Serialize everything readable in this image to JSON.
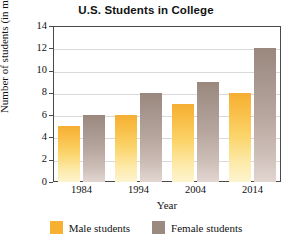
{
  "chart_data": {
    "type": "bar",
    "title": "U.S. Students in College",
    "xlabel": "Year",
    "ylabel": "Number of students (in millions)",
    "categories": [
      "1984",
      "1994",
      "2004",
      "2014"
    ],
    "series": [
      {
        "name": "Male students",
        "color": "#f7b132",
        "values": [
          5,
          6,
          7,
          8
        ]
      },
      {
        "name": "Female students",
        "color": "#9b8a80",
        "values": [
          6,
          8,
          9,
          12
        ]
      }
    ],
    "ylim": [
      0,
      14
    ],
    "ytick_step": 2,
    "yticks": [
      "0",
      "2",
      "4",
      "6",
      "8",
      "10",
      "12",
      "14"
    ],
    "grid": true,
    "legend_position": "bottom",
    "frame_color": "#4a4a4a",
    "gridline_color": "#d9d9d9",
    "background": "#ffffff"
  },
  "legend": {
    "items": [
      {
        "label": "Male students",
        "swatch": "legend-swatch-male"
      },
      {
        "label": "Female students",
        "swatch": "legend-swatch-female"
      }
    ]
  }
}
